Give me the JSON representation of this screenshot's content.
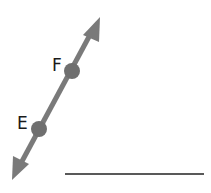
{
  "diagram": {
    "type": "line-through-two-points",
    "points": [
      {
        "label": "F"
      },
      {
        "label": "E"
      }
    ],
    "line_color": "#7a7a7a",
    "point_color": "#6f6f6f",
    "answer_line_color": "#222222"
  }
}
